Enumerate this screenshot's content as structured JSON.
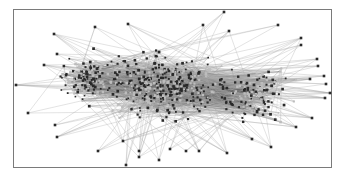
{
  "diagram": {
    "type": "network-graph",
    "frame": {
      "x": 13,
      "y": 9,
      "width": 319,
      "height": 159,
      "border_color": "#7a7a7a"
    },
    "colors": {
      "background": "#ffffff",
      "node": "#2a2a2a",
      "node_light": "#bdbdbd",
      "edge": "#555555",
      "edge_light": "#a8a8a8"
    },
    "core": {
      "clusters": [
        {
          "cx": 160,
          "cy": 85,
          "rx": 80,
          "ry": 42,
          "count": 420
        },
        {
          "cx": 255,
          "cy": 95,
          "rx": 45,
          "ry": 35,
          "count": 160
        },
        {
          "cx": 85,
          "cy": 80,
          "rx": 35,
          "ry": 30,
          "count": 120
        }
      ],
      "edge_count": 1400,
      "seed": 7
    },
    "outlier_nodes": [
      [
        224,
        12
      ],
      [
        128,
        24
      ],
      [
        95,
        27
      ],
      [
        54,
        34
      ],
      [
        203,
        25
      ],
      [
        229,
        31
      ],
      [
        278,
        25
      ],
      [
        301,
        38
      ],
      [
        301,
        45
      ],
      [
        57,
        54
      ],
      [
        44,
        65
      ],
      [
        16,
        85
      ],
      [
        28,
        113
      ],
      [
        55,
        125
      ],
      [
        57,
        137
      ],
      [
        98,
        151
      ],
      [
        126,
        165
      ],
      [
        139,
        157
      ],
      [
        159,
        160
      ],
      [
        227,
        153
      ],
      [
        271,
        147
      ],
      [
        312,
        118
      ],
      [
        296,
        127
      ],
      [
        330,
        93
      ],
      [
        325,
        98
      ],
      [
        317,
        59
      ],
      [
        318,
        66
      ],
      [
        324,
        76
      ],
      [
        326,
        84
      ],
      [
        123,
        141
      ],
      [
        186,
        151
      ],
      [
        170,
        149
      ],
      [
        199,
        151
      ],
      [
        139,
        151
      ],
      [
        252,
        139
      ],
      [
        310,
        79
      ]
    ]
  }
}
